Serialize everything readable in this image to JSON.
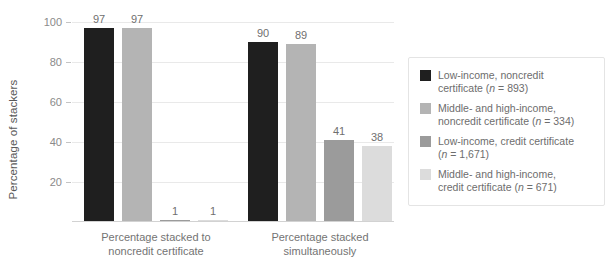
{
  "chart_data": {
    "type": "bar",
    "title": "",
    "xlabel": "",
    "ylabel": "Percentage of stackers",
    "ylim": [
      0,
      100
    ],
    "yticks": [
      0,
      20,
      40,
      60,
      80,
      100
    ],
    "grid": true,
    "legend_position": "right",
    "categories": [
      "Percentage stacked to noncredit certificate",
      "Percentage stacked simultaneously"
    ],
    "series": [
      {
        "name": "Low-income, noncredit certificate (n = 893)",
        "color": "#1f1f1f",
        "values": [
          97,
          90
        ]
      },
      {
        "name": "Middle- and high-income, noncredit certificate (n = 334)",
        "color": "#b4b4b4",
        "values": [
          97,
          89
        ]
      },
      {
        "name": "Low-income, credit certificate (n = 1,671)",
        "color": "#9b9b9b",
        "values": [
          1,
          41
        ]
      },
      {
        "name": "Middle- and high-income, credit certificate (n = 671)",
        "color": "#dcdcdc",
        "values": [
          1,
          38
        ]
      }
    ]
  },
  "axis": {
    "y_title": "Percentage of stackers",
    "y_tick_labels": [
      "100",
      "80",
      "60",
      "40",
      "20"
    ],
    "x_categories": [
      {
        "line1": "Percentage stacked to",
        "line2": "noncredit certificate"
      },
      {
        "line1": "Percentage stacked",
        "line2": "simultaneously"
      }
    ]
  },
  "bar_labels": {
    "group1": [
      "97",
      "97",
      "1",
      "1"
    ],
    "group2": [
      "90",
      "89",
      "41",
      "38"
    ]
  },
  "legend": {
    "items": [
      {
        "color": "#1f1f1f",
        "line1": "Low-income, noncredit",
        "line2_pre": "certificate (",
        "line2_italic": "n",
        "line2_post": " = 893)"
      },
      {
        "color": "#b4b4b4",
        "line1": "Middle- and high-income,",
        "line2_pre": "noncredit certificate (",
        "line2_italic": "n",
        "line2_post": " = 334)"
      },
      {
        "color": "#9b9b9b",
        "line1": "Low-income, credit certificate",
        "line2_pre": "(",
        "line2_italic": "n",
        "line2_post": " = 1,671)"
      },
      {
        "color": "#dcdcdc",
        "line1": "Middle- and high-income,",
        "line2_pre": "credit certificate (",
        "line2_italic": "n",
        "line2_post": " = 671)"
      }
    ]
  }
}
